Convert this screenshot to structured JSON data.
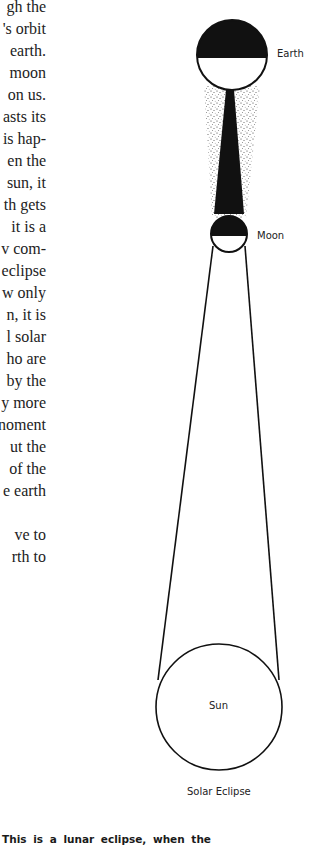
{
  "body_text": {
    "lines": [
      "gh the",
      "'s orbit",
      "earth.",
      "moon",
      "on us.",
      "asts its",
      "is hap-",
      "en the",
      "sun, it",
      "th gets",
      "it is a",
      "v com-",
      "eclipse",
      "w only",
      "n, it is",
      "l solar",
      "ho are",
      "by the",
      "y more",
      "noment",
      "ut the",
      "of the",
      "e earth",
      "",
      "ve to",
      "rth to"
    ]
  },
  "diagram": {
    "labels": {
      "earth": "Earth",
      "moon": "Moon",
      "sun": "Sun",
      "caption": "Solar Eclipse"
    },
    "colors": {
      "ink": "#111111",
      "paper": "#ffffff"
    }
  },
  "next_caption": "This is a lunar eclipse, when the"
}
